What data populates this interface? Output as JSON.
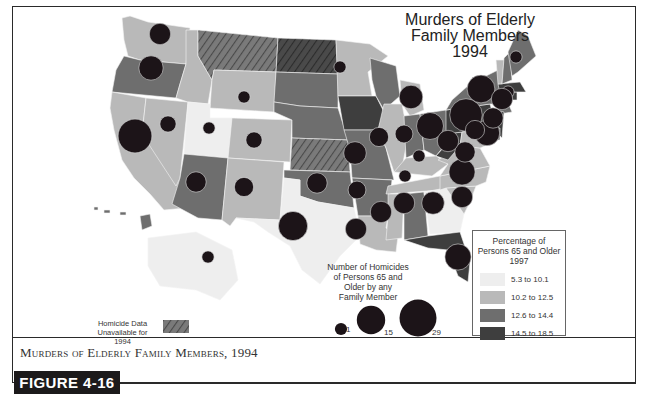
{
  "map": {
    "title_lines": [
      "Murders of Elderly",
      "Family Members",
      "1994"
    ],
    "colors": {
      "c1": "#eeeeee",
      "c2": "#b9b9b9",
      "c3": "#6e6e6e",
      "c4": "#3e3e3e",
      "no_data": "#6e6e6e",
      "bubble": "#1c1418",
      "bubble_stroke": "#d8d8d8"
    },
    "states": [
      {
        "id": "WA",
        "cls": "c2",
        "homicides": 7
      },
      {
        "id": "OR",
        "cls": "c3",
        "homicides": 10
      },
      {
        "id": "CA",
        "cls": "c2",
        "homicides": 23
      },
      {
        "id": "NV",
        "cls": "c2",
        "homicides": 3
      },
      {
        "id": "ID",
        "cls": "c2",
        "homicides": 0
      },
      {
        "id": "MT",
        "cls": "nodata",
        "homicides": null
      },
      {
        "id": "WY",
        "cls": "c2",
        "homicides": 1
      },
      {
        "id": "UT",
        "cls": "c1",
        "homicides": 1
      },
      {
        "id": "AZ",
        "cls": "c3",
        "homicides": 6
      },
      {
        "id": "CO",
        "cls": "c2",
        "homicides": 3
      },
      {
        "id": "NM",
        "cls": "c2",
        "homicides": 5
      },
      {
        "id": "ND",
        "cls": "nodata_dark",
        "homicides": null
      },
      {
        "id": "SD",
        "cls": "c3",
        "homicides": 0
      },
      {
        "id": "NE",
        "cls": "c3",
        "homicides": 0
      },
      {
        "id": "KS",
        "cls": "nodata",
        "homicides": null
      },
      {
        "id": "OK",
        "cls": "c3",
        "homicides": 6
      },
      {
        "id": "TX",
        "cls": "c1",
        "homicides": 16
      },
      {
        "id": "MN",
        "cls": "c2",
        "homicides": 1
      },
      {
        "id": "IA",
        "cls": "c4",
        "homicides": 0
      },
      {
        "id": "MO",
        "cls": "c3",
        "homicides": 8
      },
      {
        "id": "AR",
        "cls": "c3",
        "homicides": 4
      },
      {
        "id": "LA",
        "cls": "c2",
        "homicides": 7
      },
      {
        "id": "WI",
        "cls": "c3",
        "homicides": 0
      },
      {
        "id": "IL",
        "cls": "c2",
        "homicides": 5
      },
      {
        "id": "MI",
        "cls": "c2",
        "homicides": 9
      },
      {
        "id": "IN",
        "cls": "c3",
        "homicides": 4
      },
      {
        "id": "OH",
        "cls": "c3",
        "homicides": 13
      },
      {
        "id": "KY",
        "cls": "c2",
        "homicides": 1
      },
      {
        "id": "TN",
        "cls": "c2",
        "homicides": 1
      },
      {
        "id": "MS",
        "cls": "c2",
        "homicides": 7
      },
      {
        "id": "AL",
        "cls": "c3",
        "homicides": 7
      },
      {
        "id": "GA",
        "cls": "c1",
        "homicides": 8
      },
      {
        "id": "FL",
        "cls": "c4",
        "homicides": 12
      },
      {
        "id": "SC",
        "cls": "c2",
        "homicides": 7
      },
      {
        "id": "NC",
        "cls": "c2",
        "homicides": 12
      },
      {
        "id": "VA",
        "cls": "c2",
        "homicides": 6
      },
      {
        "id": "WV",
        "cls": "c4",
        "homicides": 7
      },
      {
        "id": "PA",
        "cls": "c4",
        "homicides": 21
      },
      {
        "id": "NY",
        "cls": "c3",
        "homicides": 14
      },
      {
        "id": "NJ",
        "cls": "c4",
        "homicides": 11
      },
      {
        "id": "MD",
        "cls": "c2",
        "homicides": 5
      },
      {
        "id": "DE",
        "cls": "c3",
        "homicides": 0
      },
      {
        "id": "CT",
        "cls": "c4",
        "homicides": 6
      },
      {
        "id": "RI",
        "cls": "c4",
        "homicides": 1
      },
      {
        "id": "MA",
        "cls": "c4",
        "homicides": 7
      },
      {
        "id": "VT",
        "cls": "c2",
        "homicides": 0
      },
      {
        "id": "NH",
        "cls": "c3",
        "homicides": 0
      },
      {
        "id": "ME",
        "cls": "c3",
        "homicides": 1
      },
      {
        "id": "AK",
        "cls": "c1",
        "homicides": 1
      },
      {
        "id": "HI",
        "cls": "c3",
        "homicides": 0
      }
    ]
  },
  "legend_percent": {
    "title_lines": [
      "Percentage of",
      "Persons 65 and Older",
      "1997"
    ],
    "items": [
      {
        "label": "5.3 to 10.1",
        "cls": "c1"
      },
      {
        "label": "10.2 to 12.5",
        "cls": "c2"
      },
      {
        "label": "12.6 to 14.4",
        "cls": "c3"
      },
      {
        "label": "14.5 to 18.5",
        "cls": "c4"
      }
    ]
  },
  "legend_size": {
    "title_lines": [
      "Number of Homicides",
      "of Persons 65 and",
      "Older by any",
      "Family Member"
    ],
    "items": [
      {
        "label": "1",
        "value": 1
      },
      {
        "label": "15",
        "value": 15
      },
      {
        "label": "29",
        "value": 29
      }
    ]
  },
  "legend_nodata": {
    "label_lines": [
      "Homicide Data",
      "Unavailable for 1994"
    ]
  },
  "caption": "Murders of Elderly Family Members, 1994",
  "figure_label": "FIGURE 4-16"
}
